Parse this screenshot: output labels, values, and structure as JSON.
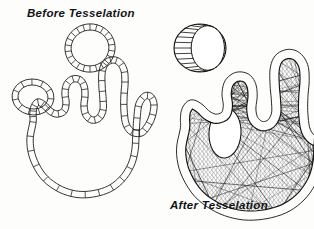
{
  "figure": {
    "title_before": "Before Tesselation",
    "title_after": "After Tesselation",
    "background_color": "#fdfdfc",
    "ink_color": "#121212",
    "panels": [
      {
        "id": "before",
        "caption": "Before Tesselation",
        "description": "Outline of a glove/hand shape and two rings drawn as un-filled quad strips (ribbed contour bands)",
        "elements": [
          {
            "name": "hand-outline",
            "style": "quad-strip-band",
            "filled": false
          },
          {
            "name": "ring-upper",
            "style": "quad-strip-band",
            "filled": false,
            "cx": 90,
            "cy": 48,
            "rx": 22,
            "ry": 21
          },
          {
            "name": "ring-left",
            "style": "quad-strip-band",
            "filled": false,
            "cx": 33,
            "cy": 97,
            "rx": 18,
            "ry": 15
          }
        ]
      },
      {
        "id": "after",
        "caption": "After Tesselation",
        "description": "Same glove/hand and ring geometry after tesselation into dense triangle meshes; interior filled with crossing triangulation lines, ring hole left open",
        "elements": [
          {
            "name": "hand-mesh",
            "style": "triangulated-mesh",
            "filled": true
          },
          {
            "name": "ring-cylinder",
            "style": "quad-strip-band",
            "filled": false,
            "cx": 200,
            "cy": 48,
            "rx": 26,
            "ry": 24
          },
          {
            "name": "palm-hole",
            "style": "open-ellipse",
            "filled": false,
            "cx": 225,
            "cy": 133,
            "rx": 16,
            "ry": 25
          }
        ]
      }
    ]
  }
}
